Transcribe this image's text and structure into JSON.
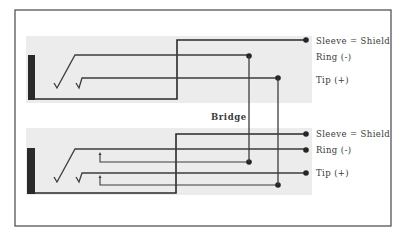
{
  "diagram": {
    "type": "wiring-diagram",
    "colors": {
      "frame": "#555555",
      "panel_bg": "#ececec",
      "wire": "#3c3c3c",
      "sleeve_wire": "#2a2a2a",
      "dot": "#262626",
      "text": "#3a3a3a"
    },
    "bridge_label": "Bridge",
    "jacks": [
      {
        "id": "top",
        "labels": {
          "sleeve": "Sleeve = Shield",
          "ring": "Ring (-)",
          "tip": "Tip (+)"
        }
      },
      {
        "id": "bottom",
        "labels": {
          "sleeve": "Sleeve = Shield",
          "ring": "Ring (-)",
          "tip": "Tip (+)"
        }
      }
    ]
  }
}
